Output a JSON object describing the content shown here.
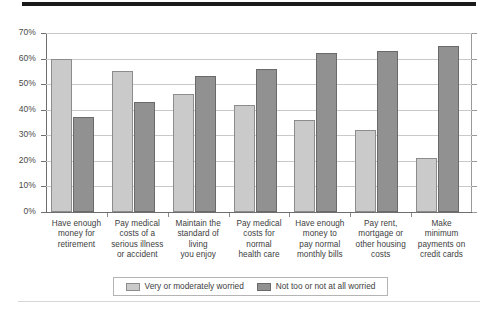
{
  "chart_data": {
    "type": "bar",
    "title": "",
    "subtitle": "",
    "xlabel": "",
    "ylabel": "",
    "ylim": [
      0,
      70
    ],
    "ytick_labels": [
      "0%",
      "10%",
      "20%",
      "30%",
      "40%",
      "50%",
      "60%",
      "70%"
    ],
    "ytick_values": [
      0,
      10,
      20,
      30,
      40,
      50,
      60,
      70
    ],
    "grid": true,
    "legend_position": "bottom",
    "categories": [
      "Have enough money for retirement",
      "Pay medical costs of a serious illness or accident",
      "Maintain the standard of living you enjoy",
      "Pay medical costs for normal health care",
      "Have enough money to pay normal monthly bills",
      "Pay rent, mortgage or other housing costs",
      "Make minimum payments on credit cards"
    ],
    "category_lines": [
      [
        "Have enough",
        "money for",
        "retirement"
      ],
      [
        "Pay medical",
        "costs of a",
        "serious illness",
        "or accident"
      ],
      [
        "Maintain the",
        "standard of",
        "living",
        "you enjoy"
      ],
      [
        "Pay medical",
        "costs for",
        "normal",
        "health care"
      ],
      [
        "Have enough",
        "money to",
        "pay normal",
        "monthly bills"
      ],
      [
        "Pay rent,",
        "mortgage or",
        "other housing",
        "costs"
      ],
      [
        "Make",
        "minimum",
        "payments on",
        "credit cards"
      ]
    ],
    "series": [
      {
        "name": "Very or moderately worried",
        "color": "#cacaca",
        "border_color": "#8c8c8c",
        "values": [
          60,
          55,
          46,
          42,
          36,
          32,
          21
        ]
      },
      {
        "name": "Not too or not at all worried",
        "color": "#919191",
        "border_color": "#6a6a6a",
        "values": [
          37,
          43,
          53,
          56,
          62,
          63,
          65
        ]
      }
    ]
  },
  "legend": {
    "items": [
      {
        "label": "Very or moderately worried"
      },
      {
        "label": "Not too or not at all worried"
      }
    ]
  }
}
